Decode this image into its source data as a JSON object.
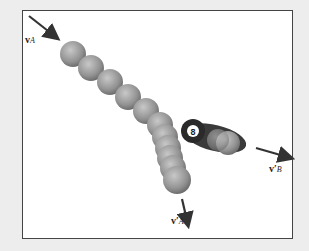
{
  "figure": {
    "type": "collision-diagram",
    "labels": {
      "va": {
        "main": "v",
        "sub": "A",
        "prime": ""
      },
      "vpa": {
        "main": "v",
        "sub": "A",
        "prime": "′"
      },
      "vpb": {
        "main": "v",
        "sub": "B",
        "prime": "′"
      }
    },
    "ball_b_number": "8",
    "colors": {
      "ball": "#9a9a9a",
      "arrow": "#333333",
      "frame": "#444444",
      "background": "#ededed"
    }
  }
}
